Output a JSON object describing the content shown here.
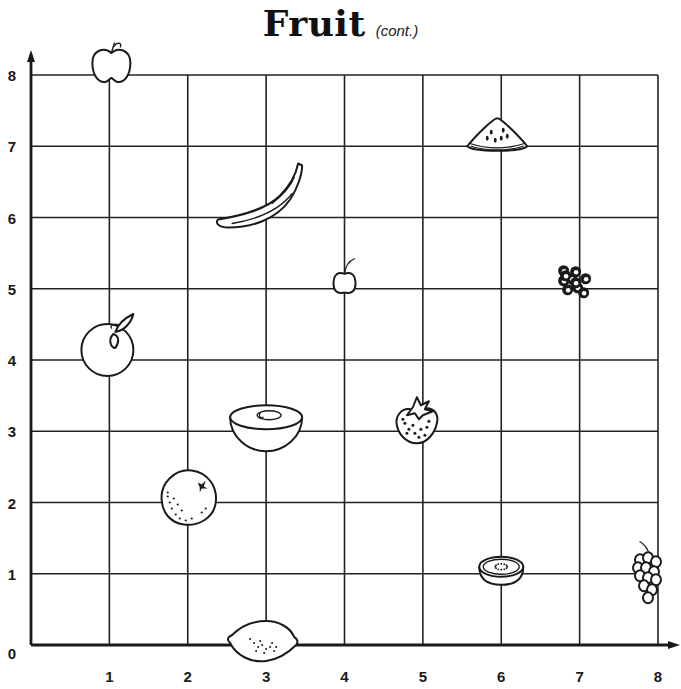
{
  "title": {
    "main": "Fruit",
    "sub": "(cont.)"
  },
  "chart_data": {
    "type": "scatter",
    "xlabel": "",
    "ylabel": "",
    "xlim": [
      0,
      8
    ],
    "ylim": [
      0,
      8
    ],
    "grid": true,
    "x_ticks": [
      "1",
      "2",
      "3",
      "4",
      "5",
      "6",
      "7",
      "8"
    ],
    "y_ticks": [
      "0",
      "1",
      "2",
      "3",
      "4",
      "5",
      "6",
      "7",
      "8"
    ],
    "points": [
      {
        "name": "apple",
        "icon": "apple-icon",
        "x": 1,
        "y": 8
      },
      {
        "name": "watermelon slice",
        "icon": "watermelon-icon",
        "x": 6,
        "y": 7
      },
      {
        "name": "banana",
        "icon": "banana-icon",
        "x": 3,
        "y": 6
      },
      {
        "name": "cherry",
        "icon": "cherry-icon",
        "x": 4,
        "y": 5
      },
      {
        "name": "blueberries",
        "icon": "blueberries-icon",
        "x": 7,
        "y": 5
      },
      {
        "name": "peach",
        "icon": "peach-icon",
        "x": 1,
        "y": 4
      },
      {
        "name": "melon half",
        "icon": "melon-icon",
        "x": 3,
        "y": 3
      },
      {
        "name": "strawberry",
        "icon": "strawberry-icon",
        "x": 5,
        "y": 3
      },
      {
        "name": "orange",
        "icon": "orange-icon",
        "x": 2,
        "y": 2
      },
      {
        "name": "kiwi half",
        "icon": "kiwi-icon",
        "x": 6,
        "y": 1
      },
      {
        "name": "grapes",
        "icon": "grapes-icon",
        "x": 8,
        "y": 1
      },
      {
        "name": "lemon",
        "icon": "lemon-icon",
        "x": 3,
        "y": 0
      }
    ]
  }
}
